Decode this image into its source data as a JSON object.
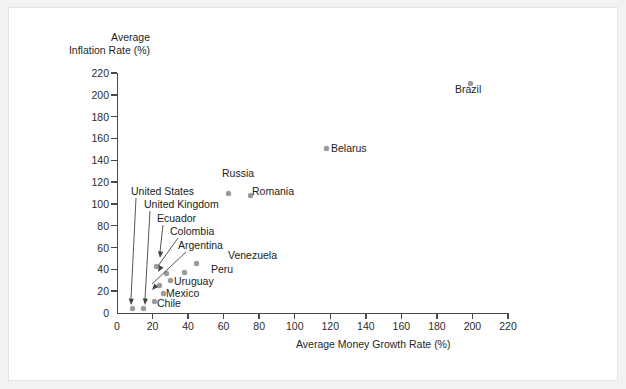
{
  "chart_data": {
    "type": "scatter",
    "title": "",
    "ylabel": "Average\nInflation Rate (%)",
    "ylabel_line1": "Average",
    "ylabel_line2": "Inflation Rate (%)",
    "xlabel": "Average Money Growth Rate (%)",
    "xlim": [
      0,
      220
    ],
    "ylim": [
      0,
      220
    ],
    "xticks": [
      0,
      20,
      40,
      60,
      80,
      100,
      120,
      140,
      160,
      180,
      200,
      220
    ],
    "yticks": [
      0,
      20,
      40,
      60,
      80,
      100,
      120,
      140,
      160,
      180,
      200,
      220
    ],
    "grid": false,
    "legend": "none",
    "marker_color": "#9a9a9a",
    "axis_color": "#4a4a4a",
    "points": [
      {
        "name": "Brazil",
        "x": 199,
        "y": 210,
        "label_pos": "below",
        "leader": false
      },
      {
        "name": "Belarus",
        "x": 118,
        "y": 151,
        "label_pos": "right",
        "leader": false
      },
      {
        "name": "Russia",
        "x": 63,
        "y": 110,
        "label_pos": "above",
        "leader": false
      },
      {
        "name": "Romania",
        "x": 75,
        "y": 108,
        "label_pos": "right",
        "leader": false
      },
      {
        "name": "Venezuela",
        "x": 45,
        "y": 45,
        "label_pos": "right",
        "leader": false
      },
      {
        "name": "Peru",
        "x": 38,
        "y": 37,
        "label_pos": "right",
        "leader": false
      },
      {
        "name": "Argentina",
        "x": 28,
        "y": 36,
        "label_pos": "leader",
        "leader": true
      },
      {
        "name": "Colombia",
        "x": 24,
        "y": 25,
        "label_pos": "leader",
        "leader": true
      },
      {
        "name": "Ecuador",
        "x": 22,
        "y": 43,
        "label_pos": "leader",
        "leader": true
      },
      {
        "name": "Uruguay",
        "x": 30,
        "y": 30,
        "label_pos": "left",
        "leader": false
      },
      {
        "name": "Mexico",
        "x": 26,
        "y": 18,
        "label_pos": "right",
        "leader": false
      },
      {
        "name": "Chile",
        "x": 21,
        "y": 11,
        "label_pos": "right",
        "leader": false
      },
      {
        "name": "United States",
        "x": 9,
        "y": 4,
        "label_pos": "leader",
        "leader": true
      },
      {
        "name": "United Kingdom",
        "x": 15,
        "y": 4,
        "label_pos": "leader",
        "leader": true
      }
    ],
    "annotations": [
      "United States",
      "United Kingdom",
      "Ecuador",
      "Colombia",
      "Argentina"
    ]
  }
}
